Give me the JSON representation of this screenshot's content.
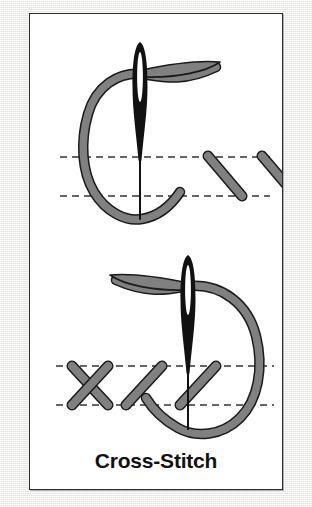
{
  "caption": {
    "title": "Cross-Stitch"
  },
  "colors": {
    "page_background": "#f4f4f2",
    "card_background": "#ffffff",
    "card_border": "#2b2b2b",
    "thread_fill": "#808080",
    "thread_outline": "#1a1a1a",
    "needle": "#111111",
    "guide_line": "#333333",
    "caption_text": "#111111"
  },
  "diagram": {
    "type": "embroidery-instruction",
    "panels": [
      {
        "id": "step-1",
        "name": "needle-entering-first-half-stitch",
        "needle": {
          "x": 110,
          "tip_y": 205,
          "top_y": 30,
          "eye_top_y": 38,
          "eye_bottom_y": 88,
          "eye_width": 7
        },
        "guide_lines": [
          {
            "name": "upper-guide-line",
            "y": 143,
            "x1": 30,
            "x2": 240
          },
          {
            "name": "lower-guide-line",
            "y": 182,
            "x1": 30,
            "x2": 240
          }
        ],
        "thread_loop": {
          "name": "thread-loop-left",
          "direction": "left",
          "description": "C-shaped thread loop curving to the left of the needle"
        },
        "stitches": [
          {
            "name": "diagonal-stitch",
            "x1": 178,
            "y1": 142,
            "x2": 212,
            "y2": 182,
            "slope": "down-right"
          },
          {
            "name": "diagonal-stitch",
            "x1": 232,
            "y1": 142,
            "x2": 266,
            "y2": 182,
            "slope": "down-right"
          }
        ]
      },
      {
        "id": "step-2",
        "name": "needle-completing-cross-stitch",
        "needle": {
          "x": 158,
          "tip_y": 415,
          "top_y": 243,
          "eye_top_y": 251,
          "eye_bottom_y": 301,
          "eye_width": 7
        },
        "guide_lines": [
          {
            "name": "upper-guide-line",
            "y": 352,
            "x1": 26,
            "x2": 244
          },
          {
            "name": "lower-guide-line",
            "y": 391,
            "x1": 26,
            "x2": 244
          }
        ],
        "thread_loop": {
          "name": "thread-loop-right",
          "direction": "right",
          "description": "D-shaped thread loop curving to the right of the needle"
        },
        "stitches": [
          {
            "name": "completed-cross-stitch-leg-a",
            "x1": 42,
            "y1": 352,
            "x2": 78,
            "y2": 391,
            "slope": "down-right"
          },
          {
            "name": "completed-cross-stitch-leg-b",
            "x1": 78,
            "y1": 352,
            "x2": 42,
            "y2": 391,
            "slope": "down-left"
          },
          {
            "name": "diagonal-stitch",
            "x1": 132,
            "y1": 352,
            "x2": 96,
            "y2": 391,
            "slope": "down-left"
          },
          {
            "name": "diagonal-stitch",
            "x1": 186,
            "y1": 352,
            "x2": 150,
            "y2": 391,
            "slope": "down-left"
          }
        ]
      }
    ]
  }
}
